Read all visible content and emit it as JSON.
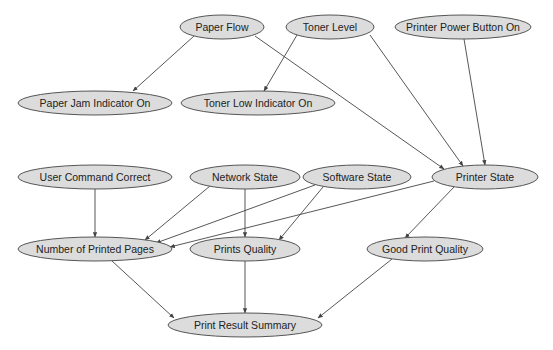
{
  "diagram": {
    "type": "bayesian-network",
    "colors": {
      "node_fill": "#dcdcdc",
      "node_stroke": "#555555",
      "edge": "#444444",
      "text": "#222222",
      "background": "#ffffff"
    },
    "nodes": [
      {
        "id": "paper_flow",
        "label": "Paper Flow",
        "cx": 222,
        "cy": 27,
        "rx": 42,
        "ry": 12
      },
      {
        "id": "toner_level",
        "label": "Toner Level",
        "cx": 330,
        "cy": 27,
        "rx": 44,
        "ry": 12
      },
      {
        "id": "printer_power",
        "label": "Printer Power Button On",
        "cx": 463,
        "cy": 27,
        "rx": 68,
        "ry": 12
      },
      {
        "id": "paper_jam",
        "label": "Paper Jam Indicator On",
        "cx": 95,
        "cy": 103,
        "rx": 77,
        "ry": 12
      },
      {
        "id": "toner_low",
        "label": "Toner Low Indicator On",
        "cx": 258,
        "cy": 103,
        "rx": 77,
        "ry": 12
      },
      {
        "id": "user_command",
        "label": "User Command Correct",
        "cx": 95,
        "cy": 177,
        "rx": 77,
        "ry": 12
      },
      {
        "id": "network_state",
        "label": "Network State",
        "cx": 245,
        "cy": 177,
        "rx": 55,
        "ry": 12
      },
      {
        "id": "software_state",
        "label": "Software State",
        "cx": 357,
        "cy": 177,
        "rx": 54,
        "ry": 12
      },
      {
        "id": "printer_state",
        "label": "Printer State",
        "cx": 485,
        "cy": 177,
        "rx": 53,
        "ry": 12
      },
      {
        "id": "num_pages",
        "label": "Number of Printed Pages",
        "cx": 95,
        "cy": 249,
        "rx": 77,
        "ry": 12
      },
      {
        "id": "prints_quality",
        "label": "Prints Quality",
        "cx": 245,
        "cy": 249,
        "rx": 55,
        "ry": 12
      },
      {
        "id": "good_quality",
        "label": "Good Print Quality",
        "cx": 425,
        "cy": 249,
        "rx": 58,
        "ry": 12
      },
      {
        "id": "result_summary",
        "label": "Print Result Summary",
        "cx": 245,
        "cy": 325,
        "rx": 77,
        "ry": 12
      }
    ],
    "edges": [
      {
        "from": "paper_flow",
        "to": "paper_jam",
        "x1": 194,
        "y1": 36,
        "x2": 133,
        "y2": 91
      },
      {
        "from": "paper_flow",
        "to": "printer_state",
        "x1": 255,
        "y1": 36,
        "x2": 444,
        "y2": 169
      },
      {
        "from": "toner_level",
        "to": "toner_low",
        "x1": 297,
        "y1": 35,
        "x2": 264,
        "y2": 91
      },
      {
        "from": "toner_level",
        "to": "printer_state",
        "x1": 370,
        "y1": 35,
        "x2": 463,
        "y2": 166
      },
      {
        "from": "printer_power",
        "to": "printer_state",
        "x1": 464,
        "y1": 39,
        "x2": 485,
        "y2": 165
      },
      {
        "from": "user_command",
        "to": "num_pages",
        "x1": 95,
        "y1": 189,
        "x2": 95,
        "y2": 237
      },
      {
        "from": "network_state",
        "to": "num_pages",
        "x1": 210,
        "y1": 186,
        "x2": 145,
        "y2": 240
      },
      {
        "from": "network_state",
        "to": "prints_quality",
        "x1": 245,
        "y1": 189,
        "x2": 245,
        "y2": 237
      },
      {
        "from": "software_state",
        "to": "num_pages",
        "x1": 315,
        "y1": 185,
        "x2": 156,
        "y2": 243
      },
      {
        "from": "software_state",
        "to": "prints_quality",
        "x1": 323,
        "y1": 187,
        "x2": 279,
        "y2": 240
      },
      {
        "from": "printer_state",
        "to": "num_pages",
        "x1": 434,
        "y1": 181,
        "x2": 170,
        "y2": 247
      },
      {
        "from": "printer_state",
        "to": "good_quality",
        "x1": 454,
        "y1": 187,
        "x2": 405,
        "y2": 238
      },
      {
        "from": "num_pages",
        "to": "result_summary",
        "x1": 112,
        "y1": 261,
        "x2": 174,
        "y2": 318
      },
      {
        "from": "prints_quality",
        "to": "result_summary",
        "x1": 245,
        "y1": 261,
        "x2": 245,
        "y2": 313
      },
      {
        "from": "good_quality",
        "to": "result_summary",
        "x1": 392,
        "y1": 259,
        "x2": 318,
        "y2": 318
      }
    ]
  }
}
